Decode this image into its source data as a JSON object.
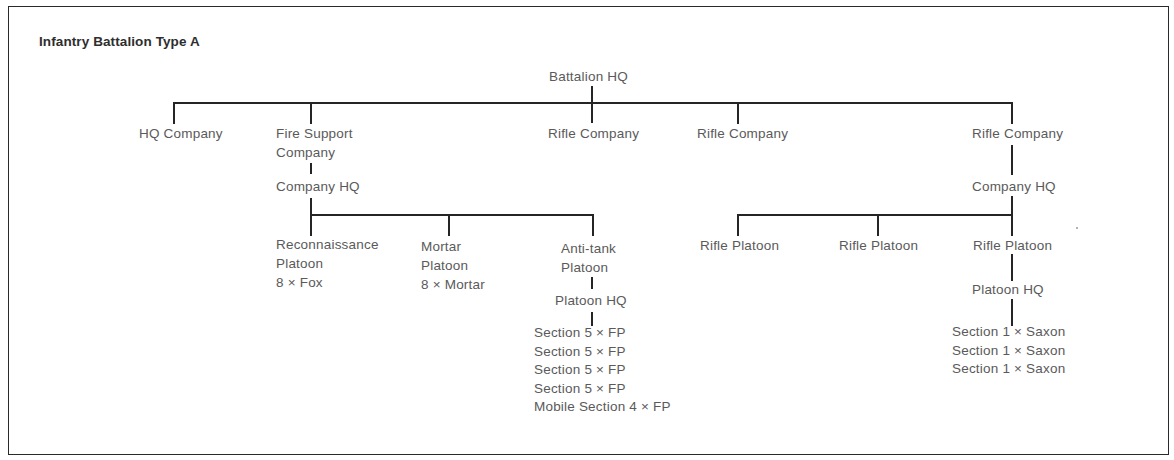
{
  "title": "Infantry Battalion Type A",
  "root": {
    "label": "Battalion HQ"
  },
  "companies": [
    {
      "label": "HQ Company"
    },
    {
      "label_lines": [
        "Fire Support",
        "Company"
      ]
    },
    {
      "label": "Rifle Company"
    },
    {
      "label": "Rifle Company"
    },
    {
      "label": "Rifle Company"
    }
  ],
  "fire_support": {
    "company_hq": "Company HQ",
    "platoons": [
      {
        "label_lines": [
          "Reconnaissance",
          "Platoon",
          "8 × Fox"
        ]
      },
      {
        "label_lines": [
          "Mortar",
          "Platoon",
          "8 × Mortar"
        ]
      },
      {
        "label_lines": [
          "Anti-tank",
          "Platoon"
        ]
      }
    ],
    "antitank": {
      "platoon_hq": "Platoon HQ",
      "sections": [
        "Section 5 × FP",
        "Section 5 × FP",
        "Section 5 × FP",
        "Section 5 × FP",
        "Mobile Section 4 × FP"
      ]
    }
  },
  "rifle_company": {
    "company_hq": "Company HQ",
    "platoons": [
      {
        "label": "Rifle Platoon"
      },
      {
        "label": "Rifle Platoon"
      },
      {
        "label": "Rifle Platoon"
      }
    ],
    "platoon_hq": "Platoon HQ",
    "sections": [
      "Section 1 × Saxon",
      "Section 1 × Saxon",
      "Section 1 × Saxon"
    ]
  },
  "colors": {
    "line": "#252525",
    "text": "#5a5a5a",
    "title": "#2e2e2e",
    "border": "#2a2a2a"
  }
}
